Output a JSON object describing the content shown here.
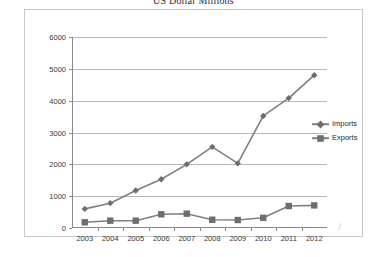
{
  "chart_data": {
    "type": "line",
    "title": "US Dollar Millions",
    "xlabel": "",
    "ylabel": "",
    "categories": [
      "2003",
      "2004",
      "2005",
      "2006",
      "2007",
      "2008",
      "2009",
      "2010",
      "2011",
      "2012"
    ],
    "series": [
      {
        "name": "Imports",
        "marker": "diamond",
        "color": "#808080",
        "values": [
          600,
          780,
          1180,
          1530,
          2000,
          2550,
          2030,
          3520,
          4080,
          4800
        ]
      },
      {
        "name": "Exports",
        "marker": "square",
        "color": "#808080",
        "values": [
          180,
          230,
          230,
          430,
          450,
          260,
          250,
          320,
          690,
          710
        ]
      }
    ],
    "ylim": [
      0,
      6000
    ],
    "yticks": [
      0,
      1000,
      2000,
      3000,
      4000,
      5000,
      6000
    ],
    "ytick_labels": [
      "0",
      "1000",
      "2000",
      "3000",
      "4000",
      "5000",
      "6000"
    ],
    "grid": true,
    "legend_position": "right"
  },
  "legend": {
    "entries": [
      {
        "label": "Imports",
        "marker": "diamond"
      },
      {
        "label": "Exports",
        "marker": "square"
      }
    ]
  },
  "annotations": {
    "stray_mark": "/"
  }
}
